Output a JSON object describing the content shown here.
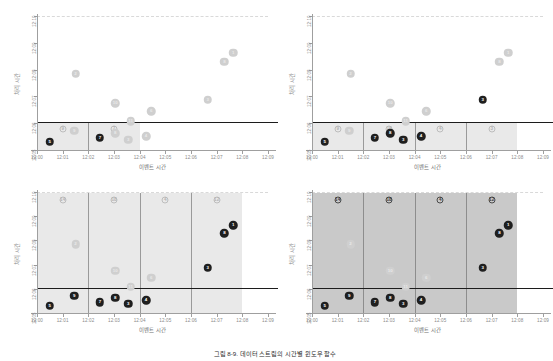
{
  "figure": {
    "caption": "그림 8-9. 데이터 스트림의 시간별 윈도우 함수",
    "axis": {
      "xlabel": "이벤트 시간",
      "ylabel": "처리 시간",
      "xticks": [
        "12:00",
        "12:01",
        "12:02",
        "12:03",
        "12:04",
        "12:05",
        "12:06",
        "12:07",
        "12:08",
        "12:09"
      ],
      "yticks": [
        "12:05",
        "12:06",
        "12:07",
        "12:08",
        "12:09",
        "12:10"
      ],
      "xlim": [
        "12:00",
        "12:09"
      ],
      "ylim": [
        "12:05",
        "12:10"
      ]
    },
    "colors": {
      "shade_light": "#e9e9e9",
      "shade_dark": "#c9c9c9",
      "marker_solid": "#1f1f1f",
      "marker_faint": "#cfcfcf",
      "threshold": "#1c1c1c",
      "axis": "#9f9f9f",
      "tick_text": "#8a8a8a"
    }
  },
  "chart_data": {
    "type": "scatter",
    "title": "데이터 스트림의 시간별 윈도우 함수",
    "xlabel": "이벤트 시간",
    "ylabel": "처리 시간",
    "xlim": [
      0,
      9
    ],
    "ylim": [
      5,
      10
    ],
    "xtick_labels": [
      "12:00",
      "12:01",
      "12:02",
      "12:03",
      "12:04",
      "12:05",
      "12:06",
      "12:07",
      "12:08",
      "12:09"
    ],
    "ytick_labels": [
      "12:05",
      "12:06",
      "12:07",
      "12:08",
      "12:09",
      "12:10"
    ],
    "grid": false,
    "legend": "none",
    "threshold_y": 6.05,
    "threshold_label": "워터마크 / 현재 처리 시각",
    "points": [
      {
        "id": "5",
        "x": 0.5,
        "y": 5.3
      },
      {
        "id": "9",
        "x": 1.45,
        "y": 5.72
      },
      {
        "id": "7",
        "x": 2.45,
        "y": 5.45
      },
      {
        "id": "8",
        "x": 3.05,
        "y": 5.62
      },
      {
        "id": "3",
        "x": 3.55,
        "y": 5.38
      },
      {
        "id": "4",
        "x": 4.25,
        "y": 5.52
      },
      {
        "id": "11",
        "x": 3.65,
        "y": 6.08
      },
      {
        "id": "6",
        "x": 4.45,
        "y": 6.45
      },
      {
        "id": "10",
        "x": 3.05,
        "y": 6.75
      },
      {
        "id": "2",
        "x": 1.5,
        "y": 7.85
      },
      {
        "id": "3b",
        "x": 6.65,
        "y": 6.88
      },
      {
        "id": "8b",
        "x": 7.3,
        "y": 8.3
      },
      {
        "id": "1",
        "x": 7.65,
        "y": 8.62
      }
    ],
    "panels": [
      {
        "key": "tumbling-unsealed",
        "position": "top-left",
        "window_mode": "single-open",
        "windows": [
          {
            "from": 0,
            "to": 2,
            "label": "9",
            "label_style": "outline"
          },
          {
            "from": 2,
            "to": 4,
            "label": "7",
            "label_style": "outline"
          }
        ],
        "shade_from": 0,
        "shade_to": 4,
        "shade_top": 6.05,
        "shade_style": "light",
        "solid_ids": [
          "5",
          "7"
        ],
        "faint_ids": [
          "9",
          "8",
          "3",
          "4",
          "11",
          "6",
          "10",
          "2",
          "3b",
          "8b",
          "1"
        ]
      },
      {
        "key": "tumbling-filling",
        "position": "top-right",
        "window_mode": "four",
        "windows": [
          {
            "from": 0,
            "to": 2,
            "label": "9",
            "label_style": "outline"
          },
          {
            "from": 2,
            "to": 4,
            "label": "18",
            "label_style": "outline"
          },
          {
            "from": 4,
            "to": 6,
            "label": "4",
            "label_style": "outline"
          },
          {
            "from": 6,
            "to": 8,
            "label": "3",
            "label_style": "outline"
          }
        ],
        "shade_from": 0,
        "shade_to": 8,
        "shade_top": 6.05,
        "shade_style": "light",
        "solid_ids": [
          "5",
          "7",
          "8",
          "3",
          "4",
          "3b"
        ],
        "faint_ids": [
          "9",
          "11",
          "6",
          "10",
          "2",
          "8b",
          "1"
        ]
      },
      {
        "key": "tumbling-closing",
        "position": "bottom-left",
        "window_mode": "four",
        "windows": [
          {
            "from": 0,
            "to": 2,
            "label": "14",
            "label_style": "outline"
          },
          {
            "from": 2,
            "to": 4,
            "label": "18",
            "label_style": "outline"
          },
          {
            "from": 4,
            "to": 6,
            "label": "4",
            "label_style": "outline"
          },
          {
            "from": 6,
            "to": 8,
            "label": "12",
            "label_style": "outline"
          }
        ],
        "shade_from": 0,
        "shade_to": 8,
        "shade_top": 9.95,
        "shade_style": "light",
        "solid_ids": [
          "5",
          "7",
          "8",
          "3",
          "4",
          "9",
          "3b",
          "8b",
          "1"
        ],
        "faint_ids": [
          "11",
          "6",
          "10",
          "2"
        ]
      },
      {
        "key": "tumbling-complete",
        "position": "bottom-right",
        "window_mode": "four",
        "windows": [
          {
            "from": 0,
            "to": 2,
            "label": "14",
            "label_style": "outline-dark"
          },
          {
            "from": 2,
            "to": 4,
            "label": "18",
            "label_style": "outline-dark"
          },
          {
            "from": 4,
            "to": 6,
            "label": "4",
            "label_style": "outline-dark"
          },
          {
            "from": 6,
            "to": 8,
            "label": "12",
            "label_style": "outline-dark"
          }
        ],
        "shade_from": 0,
        "shade_to": 8,
        "shade_top": 9.95,
        "shade_style": "dark",
        "solid_ids": [
          "5",
          "7",
          "8",
          "3",
          "4",
          "9",
          "3b",
          "8b",
          "1"
        ],
        "faint_ids": []
      }
    ]
  }
}
